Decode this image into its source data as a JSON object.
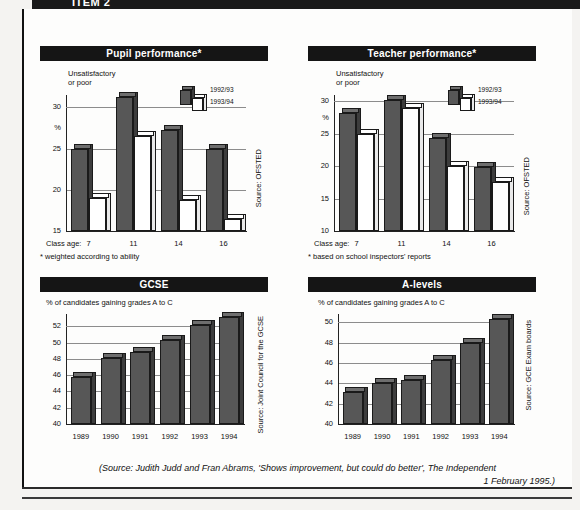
{
  "header": {
    "item_label": "ITEM 2"
  },
  "caption": {
    "line1": "(Source: Judith Judd and Fran Abrams, 'Shows improvement, but could do better', The Independent",
    "line2": "1 February 1995.)"
  },
  "legend": {
    "series1": "1992/93",
    "series2": "1993/94"
  },
  "panels": {
    "pupil": {
      "title": "Pupil performance*",
      "axis_note_l1": "Unsatisfactory",
      "axis_note_l2": "or poor",
      "percent_symbol": "%",
      "xaxis_prefix": "Class age:",
      "footnote": "* weighted according to ability",
      "source": "Source: OFSTED"
    },
    "teacher": {
      "title": "Teacher performance*",
      "axis_note_l1": "Unsatisfactory",
      "axis_note_l2": "or poor",
      "percent_symbol": "%",
      "xaxis_prefix": "Class age:",
      "footnote": "* based on school inspectors' reports",
      "source": "Source: OFSTED"
    },
    "gcse": {
      "title": "GCSE",
      "axis_note": "% of candidates gaining grades A to C",
      "source": "Source: Joint Council for the GCSE"
    },
    "alevels": {
      "title": "A-levels",
      "axis_note": "% of candidates gaining grades A to C",
      "source": "Source: GCE Exam boards"
    }
  },
  "chart_data": [
    {
      "id": "pupil",
      "type": "bar",
      "title": "Pupil performance*",
      "subtitle": "Unsatisfactory or poor",
      "xlabel": "Class age:",
      "ylabel": "%",
      "ylim": [
        15,
        31.5
      ],
      "yticks": [
        15,
        20,
        25,
        30
      ],
      "ytick_labels": [
        "15",
        "20",
        "25",
        "30"
      ],
      "grid": true,
      "legend_position": "top-right",
      "categories": [
        "7",
        "11",
        "14",
        "16"
      ],
      "series": [
        {
          "name": "1992/93",
          "color": "#575757",
          "values": [
            25.0,
            31.3,
            27.2,
            25.0
          ]
        },
        {
          "name": "1993/94",
          "color": "#ffffff",
          "values": [
            19.0,
            26.5,
            18.8,
            16.4
          ]
        }
      ],
      "annotation": "* weighted according to ability",
      "source": "Source: OFSTED"
    },
    {
      "id": "teacher",
      "type": "bar",
      "title": "Teacher performance*",
      "subtitle": "Unsatisfactory or poor",
      "xlabel": "Class age:",
      "ylabel": "%",
      "ylim": [
        10,
        31.0
      ],
      "yticks": [
        10,
        15,
        20,
        25,
        30
      ],
      "ytick_labels": [
        "10",
        "15",
        "20",
        "25",
        "30"
      ],
      "grid": true,
      "legend_position": "top-right",
      "categories": [
        "7",
        "11",
        "14",
        "16"
      ],
      "series": [
        {
          "name": "1992/93",
          "color": "#575757",
          "values": [
            28.2,
            30.2,
            24.4,
            19.9
          ]
        },
        {
          "name": "1993/94",
          "color": "#ffffff",
          "values": [
            25.0,
            29.0,
            20.0,
            17.5
          ]
        }
      ],
      "annotation": "* based on school inspectors' reports",
      "source": "Source: OFSTED"
    },
    {
      "id": "gcse",
      "type": "bar",
      "title": "GCSE",
      "subtitle": "% of candidates gaining grades A to C",
      "xlabel": "",
      "ylabel": "",
      "ylim": [
        40,
        53.5
      ],
      "yticks": [
        40,
        42,
        44,
        46,
        48,
        50,
        52
      ],
      "ytick_labels": [
        "40",
        "42",
        "44",
        "46",
        "48",
        "50",
        "52"
      ],
      "grid": true,
      "categories": [
        "1989",
        "1990",
        "1991",
        "1992",
        "1993",
        "1994"
      ],
      "series": [
        {
          "name": "% grades A to C",
          "color": "#575757",
          "values": [
            45.8,
            48.1,
            48.8,
            50.3,
            52.2,
            53.1
          ]
        }
      ],
      "source": "Source: Joint Council for the GCSE"
    },
    {
      "id": "alevels",
      "type": "bar",
      "title": "A-levels",
      "subtitle": "% of candidates gaining grades A to C",
      "xlabel": "",
      "ylabel": "",
      "ylim": [
        40,
        50.8
      ],
      "yticks": [
        40,
        42,
        44,
        46,
        48,
        50
      ],
      "ytick_labels": [
        "40",
        "42",
        "44",
        "46",
        "48",
        "50"
      ],
      "grid": true,
      "categories": [
        "1989",
        "1990",
        "1991",
        "1992",
        "1993",
        "1994"
      ],
      "series": [
        {
          "name": "% grades A to C",
          "color": "#575757",
          "values": [
            43.1,
            44.0,
            44.3,
            46.3,
            48.0,
            50.3
          ]
        }
      ],
      "source": "Source: GCE Exam boards"
    }
  ]
}
